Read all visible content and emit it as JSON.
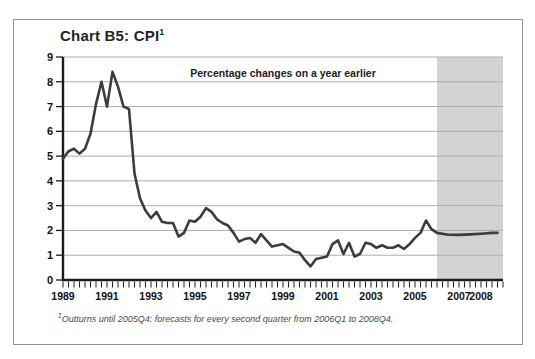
{
  "title": {
    "text": "Chart B5: CPI",
    "superscript": "1"
  },
  "annotation": "Percentage changes on a year earlier",
  "footnote": {
    "superscript": "1",
    "text": "Outturns until 2005Q4: forecasts for every second quarter from 2006Q1 to 2008Q4."
  },
  "colors": {
    "line": "#3c3c3c",
    "grid": "#adadad",
    "axis": "#1c1c1c",
    "band": "#d3d3d3",
    "box_border": "#8f8f8f",
    "background": "#ffffff",
    "tick_label": "#111111",
    "footnote_text": "#4a4a4a"
  },
  "chart_data": {
    "type": "line",
    "title": "Chart B5: CPI",
    "subtitle": "Percentage changes on a year earlier",
    "xlabel": "",
    "ylabel": "",
    "ylim": [
      0,
      9
    ],
    "xlim_years": [
      1989,
      2009
    ],
    "grid": "horizontal",
    "y_ticks": [
      0,
      1,
      2,
      3,
      4,
      5,
      6,
      7,
      8,
      9
    ],
    "x_tick_labels": [
      "1989",
      "1991",
      "1993",
      "1995",
      "1997",
      "1999",
      "2001",
      "2003",
      "2005",
      "2007",
      "2008"
    ],
    "x_minor_tick_interval_years": 0.25,
    "forecast_band": {
      "from_year": 2006.0,
      "to_year": 2009.0
    },
    "series": [
      {
        "name": "CPI outturn (quarterly)",
        "start_year": 1989.0,
        "step_years": 0.25,
        "values": [
          4.9,
          5.2,
          5.3,
          5.1,
          5.3,
          5.9,
          7.1,
          8.0,
          7.0,
          8.4,
          7.8,
          7.0,
          6.9,
          4.3,
          3.3,
          2.8,
          2.5,
          2.75,
          2.35,
          2.3,
          2.3,
          1.75,
          1.9,
          2.4,
          2.35,
          2.55,
          2.9,
          2.75,
          2.45,
          2.3,
          2.2,
          1.9,
          1.55,
          1.65,
          1.7,
          1.5,
          1.85,
          1.6,
          1.35,
          1.4,
          1.45,
          1.3,
          1.15,
          1.1,
          0.8,
          0.55,
          0.85,
          0.9,
          0.95,
          1.45,
          1.6,
          1.05,
          1.5,
          0.95,
          1.05,
          1.5,
          1.45,
          1.3,
          1.4,
          1.3,
          1.3,
          1.4,
          1.25,
          1.45,
          1.7,
          1.9,
          2.4,
          2.05
        ]
      },
      {
        "name": "CPI forecast (every second quarter)",
        "x_years": [
          2006.0,
          2006.5,
          2007.0,
          2007.5,
          2008.0,
          2008.5,
          2008.75
        ],
        "values": [
          1.9,
          1.83,
          1.82,
          1.84,
          1.87,
          1.9,
          1.9
        ]
      }
    ]
  }
}
